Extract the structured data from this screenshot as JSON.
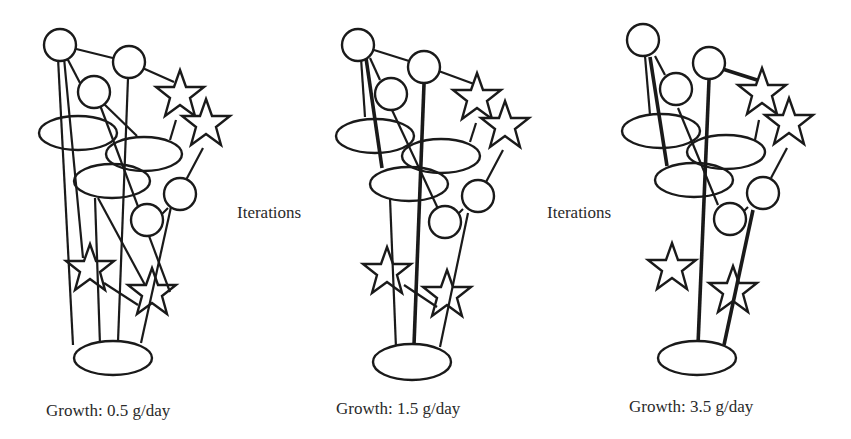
{
  "figure": {
    "panels": [
      {
        "id": "panel-1",
        "caption": "Growth: 0.5 g/day",
        "growth_value": 0.5,
        "growth_unit": "g/day"
      },
      {
        "id": "panel-2",
        "caption": "Growth: 1.5 g/day",
        "growth_value": 1.5,
        "growth_unit": "g/day"
      },
      {
        "id": "panel-3",
        "caption": "Growth: 3.5 g/day",
        "growth_value": 3.5,
        "growth_unit": "g/day"
      }
    ],
    "arrows_text": [
      {
        "label": "Iterations"
      },
      {
        "label": "Iterations"
      }
    ],
    "node_shapes": [
      "circle",
      "star",
      "ellipse"
    ],
    "colors": {
      "stroke": "#1a1a1a",
      "fill": "#ffffff",
      "text": "#2a2a2a"
    }
  }
}
